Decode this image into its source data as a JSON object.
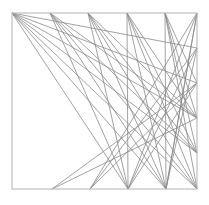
{
  "figure": {
    "title": "",
    "caption": "",
    "background_color": "#ffffff",
    "width": 209,
    "height": 205
  },
  "chart_data": {
    "type": "line",
    "title": "",
    "subtitle": "",
    "xlabel": "",
    "ylabel": "",
    "xlim": [
      12,
      197
    ],
    "ylim": [
      13,
      189
    ],
    "grid": false,
    "legend": false,
    "legend_position": "none",
    "annotations": [],
    "tick_labels": {
      "x": [],
      "y": []
    },
    "frame": {
      "x": 12,
      "y": 13,
      "width": 185,
      "height": 176,
      "stroke": "#b9b9b9",
      "stroke_width": 1.1
    },
    "style": {
      "segment_stroke": "#8a8a8a",
      "segment_stroke_light": "#a8a8a8",
      "segment_stroke_dark": "#6f6f6f",
      "segment_width": 0.8
    },
    "hub_points": {
      "top": [
        {
          "name": "T0",
          "x": 12,
          "y": 13
        },
        {
          "name": "T1",
          "x": 50,
          "y": 13
        },
        {
          "name": "T2",
          "x": 88,
          "y": 13
        },
        {
          "name": "T3",
          "x": 127,
          "y": 13
        },
        {
          "name": "T4",
          "x": 165,
          "y": 13
        },
        {
          "name": "T5",
          "x": 197,
          "y": 13
        }
      ],
      "bottom": [
        {
          "name": "B0",
          "x": 12,
          "y": 189
        },
        {
          "name": "B1",
          "x": 52,
          "y": 189
        },
        {
          "name": "B2",
          "x": 90,
          "y": 189
        },
        {
          "name": "B3",
          "x": 128,
          "y": 189
        },
        {
          "name": "B4",
          "x": 166,
          "y": 189
        },
        {
          "name": "B5",
          "x": 197,
          "y": 189
        }
      ],
      "right": [
        {
          "name": "R0",
          "x": 197,
          "y": 13
        },
        {
          "name": "R1",
          "x": 197,
          "y": 48
        },
        {
          "name": "R2",
          "x": 197,
          "y": 83
        },
        {
          "name": "R3",
          "x": 197,
          "y": 118
        },
        {
          "name": "R4",
          "x": 197,
          "y": 153
        },
        {
          "name": "R5",
          "x": 197,
          "y": 189
        }
      ]
    },
    "series": [
      {
        "name": "fan-from-top-left",
        "color": "#8a8a8a",
        "segments": [
          {
            "x1": 12,
            "y1": 13,
            "x2": 197,
            "y2": 48
          },
          {
            "x1": 12,
            "y1": 13,
            "x2": 197,
            "y2": 83
          },
          {
            "x1": 12,
            "y1": 13,
            "x2": 197,
            "y2": 118
          },
          {
            "x1": 12,
            "y1": 13,
            "x2": 197,
            "y2": 153
          },
          {
            "x1": 12,
            "y1": 13,
            "x2": 197,
            "y2": 189
          },
          {
            "x1": 12,
            "y1": 13,
            "x2": 166,
            "y2": 189
          },
          {
            "x1": 12,
            "y1": 13,
            "x2": 128,
            "y2": 189
          }
        ]
      },
      {
        "name": "fan-from-top-t1",
        "color": "#8a8a8a",
        "segments": [
          {
            "x1": 50,
            "y1": 13,
            "x2": 197,
            "y2": 118
          },
          {
            "x1": 50,
            "y1": 13,
            "x2": 197,
            "y2": 153
          },
          {
            "x1": 50,
            "y1": 13,
            "x2": 197,
            "y2": 189
          },
          {
            "x1": 50,
            "y1": 13,
            "x2": 166,
            "y2": 189
          },
          {
            "x1": 50,
            "y1": 13,
            "x2": 128,
            "y2": 189
          }
        ]
      },
      {
        "name": "fan-from-top-t2",
        "color": "#8a8a8a",
        "segments": [
          {
            "x1": 88,
            "y1": 13,
            "x2": 197,
            "y2": 118
          },
          {
            "x1": 88,
            "y1": 13,
            "x2": 197,
            "y2": 153
          },
          {
            "x1": 88,
            "y1": 13,
            "x2": 197,
            "y2": 189
          },
          {
            "x1": 88,
            "y1": 13,
            "x2": 166,
            "y2": 189
          },
          {
            "x1": 88,
            "y1": 13,
            "x2": 128,
            "y2": 189
          }
        ]
      },
      {
        "name": "fan-from-top-t3",
        "color": "#8a8a8a",
        "segments": [
          {
            "x1": 127,
            "y1": 13,
            "x2": 197,
            "y2": 118
          },
          {
            "x1": 127,
            "y1": 13,
            "x2": 197,
            "y2": 153
          },
          {
            "x1": 127,
            "y1": 13,
            "x2": 197,
            "y2": 189
          },
          {
            "x1": 127,
            "y1": 13,
            "x2": 166,
            "y2": 189
          },
          {
            "x1": 127,
            "y1": 13,
            "x2": 128,
            "y2": 189
          }
        ]
      },
      {
        "name": "fan-from-top-t4",
        "color": "#8a8a8a",
        "segments": [
          {
            "x1": 165,
            "y1": 13,
            "x2": 197,
            "y2": 83
          },
          {
            "x1": 165,
            "y1": 13,
            "x2": 197,
            "y2": 118
          },
          {
            "x1": 165,
            "y1": 13,
            "x2": 197,
            "y2": 153
          },
          {
            "x1": 165,
            "y1": 13,
            "x2": 197,
            "y2": 189
          },
          {
            "x1": 165,
            "y1": 13,
            "x2": 166,
            "y2": 189
          }
        ]
      },
      {
        "name": "fan-from-top-right",
        "color": "#8a8a8a",
        "segments": [
          {
            "x1": 197,
            "y1": 13,
            "x2": 166,
            "y2": 189
          },
          {
            "x1": 197,
            "y1": 13,
            "x2": 128,
            "y2": 189
          },
          {
            "x1": 197,
            "y1": 13,
            "x2": 90,
            "y2": 189
          }
        ]
      },
      {
        "name": "rising-diagonals-to-right-edge",
        "color": "#8a8a8a",
        "segments": [
          {
            "x1": 52,
            "y1": 189,
            "x2": 197,
            "y2": 83
          },
          {
            "x1": 52,
            "y1": 189,
            "x2": 197,
            "y2": 118
          },
          {
            "x1": 90,
            "y1": 189,
            "x2": 197,
            "y2": 48
          },
          {
            "x1": 90,
            "y1": 189,
            "x2": 197,
            "y2": 83
          },
          {
            "x1": 128,
            "y1": 189,
            "x2": 197,
            "y2": 48
          },
          {
            "x1": 128,
            "y1": 189,
            "x2": 197,
            "y2": 83
          },
          {
            "x1": 166,
            "y1": 189,
            "x2": 197,
            "y2": 48
          },
          {
            "x1": 166,
            "y1": 189,
            "x2": 197,
            "y2": 13
          }
        ]
      }
    ]
  }
}
